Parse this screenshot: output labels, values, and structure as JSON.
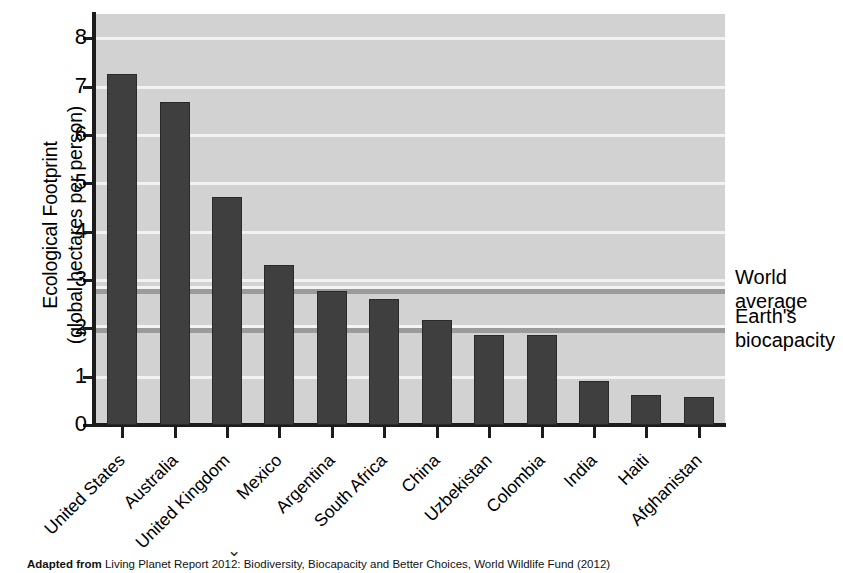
{
  "chart_data": {
    "type": "bar",
    "title": "",
    "xlabel": "",
    "ylabel": "Ecological Footprint (global hectares per person)",
    "ylabel_lines": [
      "Ecological Footprint",
      "(global hectares per person)"
    ],
    "ylim": [
      0,
      8.5
    ],
    "yticks": [
      0,
      1,
      2,
      3,
      4,
      5,
      6,
      7,
      8
    ],
    "ytick_labels": [
      "0",
      "1",
      "2",
      "3",
      "4",
      "5",
      "6",
      "7",
      "8"
    ],
    "grid": true,
    "grid_color": "#f2f2f2",
    "plot_background": "#d2d2d2",
    "bar_color": "#3f3f3f",
    "legend": "none",
    "categories": [
      "United States",
      "Australia",
      "United Kingdom",
      "Mexico",
      "Argentina",
      "South Africa",
      "China",
      "Uzbekistan",
      "Colombia",
      "India",
      "Haiti",
      "Afghanistan"
    ],
    "values": [
      7.25,
      6.68,
      4.72,
      3.31,
      2.77,
      2.6,
      2.18,
      1.86,
      1.86,
      0.9,
      0.62,
      0.58
    ],
    "reference_lines": [
      {
        "label": "World average",
        "label_lines": [
          "World",
          "average"
        ],
        "value": 2.78,
        "color": "#9b9b9b"
      },
      {
        "label": "Earth's biocapacity",
        "label_lines": [
          "Earth's",
          "biocapacity"
        ],
        "value": 1.96,
        "color": "#9b9b9b"
      }
    ]
  },
  "caption": {
    "prefix": "Adapted from",
    "text": " Living Planet Report 2012: Biodiversity, Biocapacity and Better Choices, World Wildlife Fund (2012)"
  }
}
